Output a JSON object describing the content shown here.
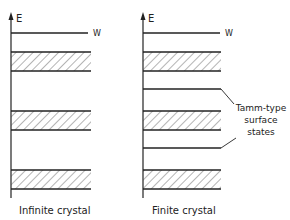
{
  "diagrams": [
    {
      "caption": "Infinite crystal",
      "axis_label": "E",
      "level_label": "W"
    },
    {
      "caption": "Finite crystal",
      "axis_label": "E",
      "level_label": "W",
      "annotation": [
        "Tamm-type",
        "surface",
        "states"
      ]
    }
  ],
  "colors": {
    "line": "#222222",
    "background": "#ffffff"
  }
}
